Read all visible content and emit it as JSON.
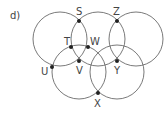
{
  "diagram": {
    "label": "d)",
    "stroke_color": "#6a6a6a",
    "point_color": "#222222",
    "circles": [
      {
        "id": "c1",
        "cx": 60,
        "cy": 39,
        "r": 27
      },
      {
        "id": "c2",
        "cx": 98,
        "cy": 39,
        "r": 27
      },
      {
        "id": "c3",
        "cx": 136,
        "cy": 39,
        "r": 27
      },
      {
        "id": "c4",
        "cx": 79,
        "cy": 72,
        "r": 27
      },
      {
        "id": "c5",
        "cx": 117,
        "cy": 72,
        "r": 27
      }
    ],
    "points": [
      {
        "name": "S",
        "x": 79,
        "y": 21,
        "lx": 76,
        "ly": 15
      },
      {
        "name": "Z",
        "x": 117,
        "y": 21,
        "lx": 113,
        "ly": 15
      },
      {
        "name": "T",
        "x": 71,
        "y": 47,
        "lx": 64,
        "ly": 45
      },
      {
        "name": "W",
        "x": 88,
        "y": 47,
        "lx": 90,
        "ly": 45
      },
      {
        "name": "V",
        "x": 79,
        "y": 61,
        "lx": 76,
        "ly": 74
      },
      {
        "name": "Y",
        "x": 117,
        "y": 61,
        "lx": 114,
        "ly": 74
      },
      {
        "name": "U",
        "x": 52,
        "y": 67,
        "lx": 41,
        "ly": 75
      },
      {
        "name": "X",
        "x": 98,
        "y": 93,
        "lx": 94,
        "ly": 107
      }
    ]
  }
}
